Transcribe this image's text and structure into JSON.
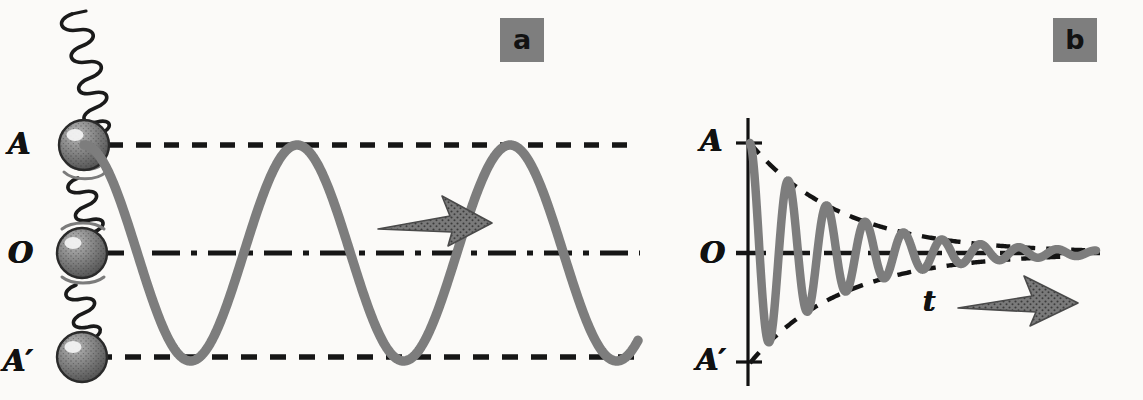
{
  "figure": {
    "background_color": "#fbfaf8",
    "ink_color": "#111111",
    "curve_color": "#7d7d7d",
    "badge_color": "#7e7e7e",
    "arrow_color": "#6f6f6f"
  },
  "panels": [
    {
      "id": "a",
      "badge_label": "a",
      "description": "Spring-mass oscillator with undamped sinusoidal displacement-time trace",
      "labels": {
        "amplitude_top": "A",
        "equilibrium": "O",
        "amplitude_bottom": "A′"
      },
      "reference_lines": [
        {
          "name": "amplitude-top-line",
          "level": "A",
          "y": 145,
          "style": "dashed"
        },
        {
          "name": "equilibrium-line",
          "level": "O",
          "y": 253,
          "style": "dash-dot"
        },
        {
          "name": "amplitude-bottom-line",
          "level": "A′",
          "y": 357,
          "style": "dashed"
        }
      ],
      "spring_mass": {
        "ball_count": 3,
        "ball_positions": [
          "A",
          "O",
          "A′"
        ],
        "spring_segments": 3,
        "motion_arcs": true
      },
      "direction_arrow": {
        "name": "time-direction-arrow",
        "points": "right"
      }
    },
    {
      "id": "b",
      "badge_label": "b",
      "description": "Damped oscillation decaying toward equilibrium with exponential envelope",
      "labels": {
        "amplitude_top": "A",
        "equilibrium": "O",
        "amplitude_bottom": "A′",
        "time_axis": "t"
      },
      "axes": {
        "vertical_axis_x": 748,
        "horizontal_axis_y": 253,
        "ticks": [
          "A",
          "O",
          "A′"
        ]
      },
      "envelope": {
        "name": "decay-envelope",
        "style": "dashed"
      },
      "direction_arrow": {
        "name": "time-direction-arrow",
        "points": "right"
      }
    }
  ],
  "chart_data": [
    {
      "type": "line",
      "name": "undamped-oscillation",
      "panel": "a",
      "title": "Undamped simple harmonic oscillation",
      "xlabel": "",
      "ylabel": "displacement",
      "ylim": [
        -1,
        1
      ],
      "yticks": [
        1,
        0,
        -1
      ],
      "yticklabels": [
        "A",
        "O",
        "A′"
      ],
      "amplitude": 1,
      "cycles": 2.6,
      "grid": false,
      "legend": false,
      "x": [
        0,
        0.1,
        0.2,
        0.3,
        0.4,
        0.5,
        0.6,
        0.7,
        0.8,
        0.9,
        1.0,
        1.1,
        1.2,
        1.3,
        1.4,
        1.5,
        1.6,
        1.7,
        1.8,
        1.9,
        2.0,
        2.1,
        2.2,
        2.3,
        2.4,
        2.5,
        2.6
      ],
      "values": [
        1.0,
        0.809,
        0.309,
        -0.309,
        -0.809,
        -1.0,
        -0.809,
        -0.309,
        0.309,
        0.809,
        1.0,
        0.809,
        0.309,
        -0.309,
        -0.809,
        -1.0,
        -0.809,
        -0.309,
        0.309,
        0.809,
        1.0,
        0.809,
        0.309,
        -0.309,
        -0.809,
        -1.0,
        -0.809
      ]
    },
    {
      "type": "line",
      "name": "damped-oscillation",
      "panel": "b",
      "title": "Damped oscillation",
      "xlabel": "t",
      "ylabel": "displacement",
      "ylim": [
        -1,
        1
      ],
      "yticks": [
        1,
        0,
        -1
      ],
      "yticklabels": [
        "A",
        "O",
        "A′"
      ],
      "initial_amplitude": 1,
      "decay_constant": 0.42,
      "cycles": 9,
      "grid": false,
      "legend": false,
      "series": [
        {
          "name": "displacement",
          "style": "solid",
          "x": [
            0.0,
            0.25,
            0.5,
            0.75,
            1.0,
            1.25,
            1.5,
            1.75,
            2.0,
            2.25,
            2.5,
            2.75,
            3.0,
            3.25,
            3.5,
            3.75,
            4.0,
            4.25,
            4.5,
            4.75,
            5.0,
            5.5,
            6.0,
            6.5,
            7.0,
            7.5,
            8.0,
            8.5,
            9.0
          ],
          "values": [
            1.0,
            0.0,
            -0.81,
            0.0,
            0.66,
            0.0,
            -0.54,
            0.0,
            0.43,
            0.0,
            -0.35,
            0.0,
            0.29,
            0.0,
            -0.23,
            0.0,
            0.19,
            0.0,
            -0.15,
            0.0,
            0.12,
            -0.08,
            0.05,
            -0.035,
            0.02,
            -0.012,
            0.008,
            -0.004,
            0.0
          ]
        },
        {
          "name": "upper-envelope",
          "style": "dashed",
          "x": [
            0,
            1,
            2,
            3,
            4,
            5,
            6,
            7,
            8,
            9
          ],
          "values": [
            1.0,
            0.66,
            0.43,
            0.29,
            0.19,
            0.12,
            0.08,
            0.05,
            0.03,
            0.0
          ]
        },
        {
          "name": "lower-envelope",
          "style": "dashed",
          "x": [
            0,
            1,
            2,
            3,
            4,
            5,
            6,
            7,
            8,
            9
          ],
          "values": [
            -1.0,
            -0.66,
            -0.43,
            -0.29,
            -0.19,
            -0.12,
            -0.08,
            -0.05,
            -0.03,
            0.0
          ]
        }
      ]
    }
  ]
}
